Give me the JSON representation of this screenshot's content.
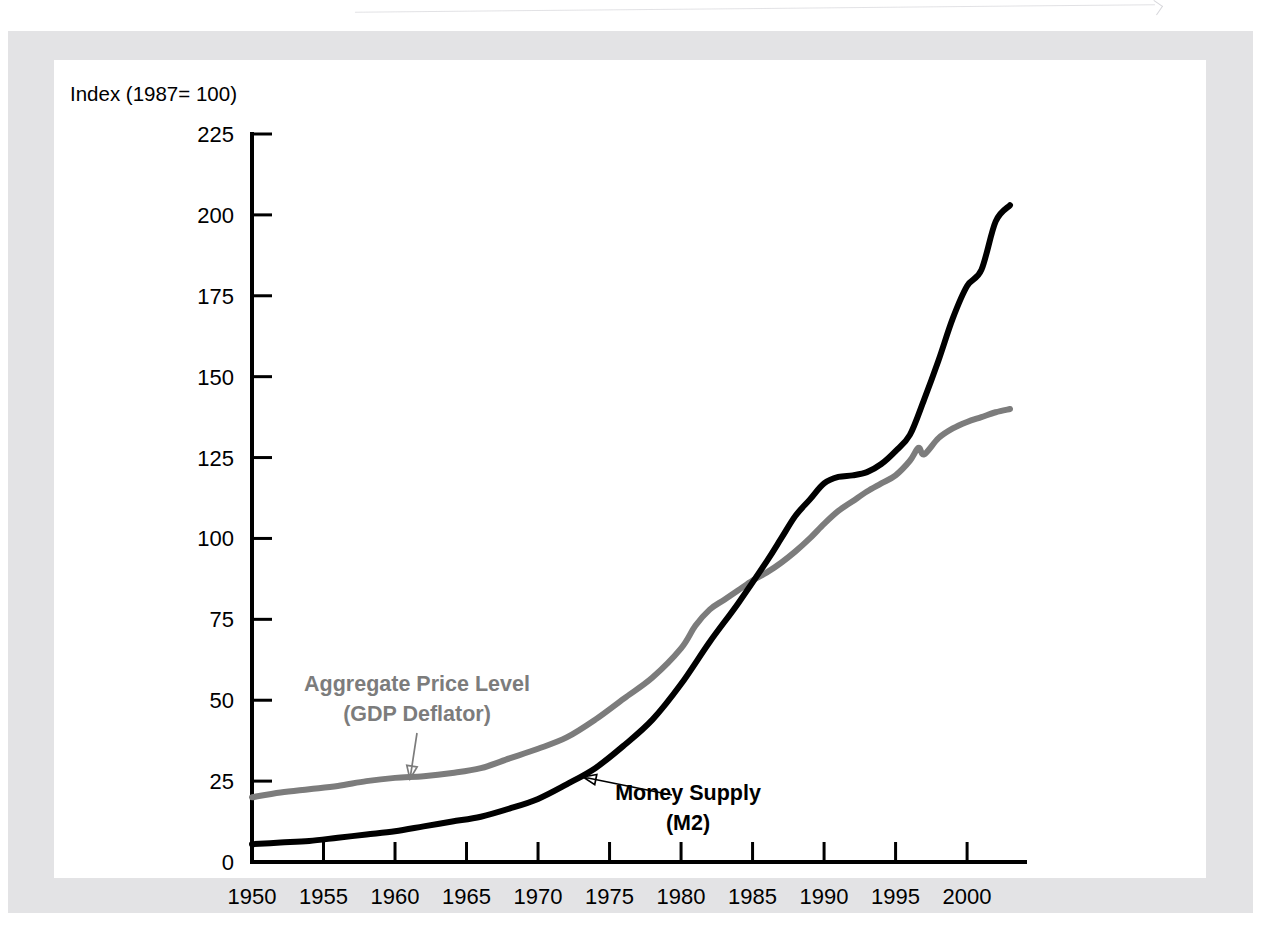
{
  "figure": {
    "y_axis_title": "Index (1987= 100)",
    "background_color": "#ffffff",
    "page_border_color": "#e3e3e5"
  },
  "annotations": [
    {
      "id": "gray-label",
      "line1": "Aggregate Price Level",
      "line2": "(GDP Deflator)",
      "color": "#7c7c7c",
      "text_x": 417,
      "text_y1": 691,
      "text_y2": 721,
      "arrow_from_x": 417,
      "arrow_from_y": 733,
      "arrow_to_x": 410,
      "arrow_to_y": 779
    },
    {
      "id": "black-label",
      "line1": "Money Supply",
      "line2": "(M2)",
      "color": "#000000",
      "text_x": 688,
      "text_y1": 800,
      "text_y2": 830,
      "arrow_from_x": 672,
      "arrow_from_y": 795,
      "arrow_to_x": 583,
      "arrow_to_y": 777
    }
  ],
  "chart_data": {
    "type": "line",
    "title": "",
    "subtitle": "",
    "xlabel": "",
    "ylabel": "Index (1987= 100)",
    "xlim": [
      1950,
      2003
    ],
    "ylim": [
      0,
      225
    ],
    "xticks": [
      1950,
      1955,
      1960,
      1965,
      1970,
      1975,
      1980,
      1985,
      1990,
      1995,
      2000
    ],
    "xtick_labels": [
      "1950",
      "1955",
      "1960",
      "1965",
      "1970",
      "1975",
      "1980",
      "1985",
      "1990",
      "1995",
      "2000"
    ],
    "yticks": [
      0,
      25,
      50,
      75,
      100,
      125,
      150,
      175,
      200,
      225
    ],
    "ytick_labels": [
      "0",
      "25",
      "50",
      "75",
      "100",
      "125",
      "150",
      "175",
      "200",
      "225"
    ],
    "grid": false,
    "legend": "annotations-inline",
    "series": [
      {
        "name": "Aggregate Price Level (GDP Deflator)",
        "short_name": "GDP Deflator",
        "color": "#7c7c7c",
        "stroke_width": 6,
        "x": [
          1950,
          1952,
          1954,
          1956,
          1958,
          1960,
          1962,
          1964,
          1966,
          1968,
          1970,
          1972,
          1974,
          1976,
          1978,
          1980,
          1981,
          1982,
          1983,
          1984,
          1985,
          1986,
          1987,
          1988,
          1989,
          1990,
          1991,
          1992,
          1993,
          1994,
          1995,
          1996,
          1996.6,
          1997,
          1998,
          1999,
          2000,
          2001,
          2002,
          2003
        ],
        "values": [
          20,
          21.5,
          22.5,
          23.5,
          25,
          26,
          26.5,
          27.5,
          29,
          32,
          35,
          38.5,
          44,
          50.5,
          57,
          66,
          73,
          78,
          81,
          84,
          87,
          89.5,
          92.5,
          96,
          100,
          104.5,
          108.5,
          111.5,
          114.5,
          117,
          119.5,
          124,
          128,
          126,
          131,
          134,
          136,
          137.5,
          139,
          140
        ]
      },
      {
        "name": "Money Supply (M2)",
        "short_name": "M2",
        "color": "#000000",
        "stroke_width": 6,
        "x": [
          1950,
          1952,
          1954,
          1956,
          1958,
          1960,
          1962,
          1964,
          1966,
          1968,
          1970,
          1972,
          1974,
          1976,
          1978,
          1980,
          1982,
          1984,
          1986,
          1987,
          1988,
          1989,
          1990,
          1991,
          1992,
          1993,
          1994,
          1995,
          1996,
          1997,
          1998,
          1999,
          2000,
          2001,
          2002,
          2003
        ],
        "values": [
          5.5,
          6,
          6.5,
          7.5,
          8.5,
          9.5,
          11,
          12.5,
          14,
          16.5,
          19.5,
          24,
          29,
          36,
          44,
          55,
          68,
          80,
          93,
          100,
          107,
          112,
          117,
          119,
          119.5,
          120.5,
          123,
          127,
          132,
          143,
          155,
          168,
          178,
          183,
          198,
          203
        ]
      }
    ]
  }
}
